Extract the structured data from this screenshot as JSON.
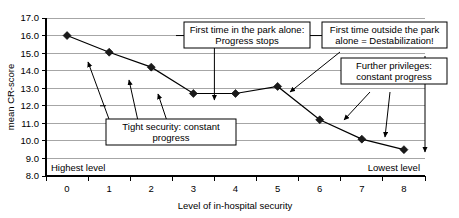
{
  "chart_data": {
    "type": "line",
    "title": "",
    "xlabel": "Level of in-hospital security",
    "ylabel": "mean CR-score",
    "categories": [
      "0",
      "1",
      "2",
      "3",
      "4",
      "5",
      "6",
      "7",
      "8"
    ],
    "x": [
      0,
      1,
      2,
      3,
      4,
      5,
      6,
      7,
      8
    ],
    "values": [
      16.0,
      15.05,
      14.2,
      12.7,
      12.7,
      13.1,
      11.2,
      10.1,
      9.5
    ],
    "series": [
      {
        "name": "mean CR-score",
        "values": [
          16.0,
          15.05,
          14.2,
          12.7,
          12.7,
          13.1,
          11.2,
          10.1,
          9.5
        ]
      }
    ],
    "ylim": [
      8.0,
      17.0
    ],
    "ytick_labels": [
      "8.0",
      "9.0",
      "10.0",
      "11.0",
      "12.0",
      "13.0",
      "14.0",
      "15.0",
      "16.0",
      "17.0"
    ],
    "ytick_values": [
      8.0,
      9.0,
      10.0,
      11.0,
      12.0,
      13.0,
      14.0,
      15.0,
      16.0,
      17.0
    ],
    "xtick_labels": [
      "0",
      "1",
      "2",
      "3",
      "4",
      "5",
      "6",
      "7",
      "8"
    ],
    "grid": "horizontal",
    "legend": "none",
    "marker": "diamond",
    "line_color": "#000000",
    "marker_color": "#1a1a1a",
    "grid_color": "#a6a6a6"
  },
  "annotations": {
    "plot_labels": [
      {
        "id": "highest-level",
        "text": "Highest level"
      },
      {
        "id": "lowest-level",
        "text": "Lowest level"
      }
    ],
    "callouts": [
      {
        "id": "tight-security",
        "line1": "Tight security: constant",
        "line2": "progress"
      },
      {
        "id": "first-time-park-alone",
        "line1": "First time in the park alone:",
        "line2": "Progress stops"
      },
      {
        "id": "first-time-outside-park",
        "line1": "First time outside the park",
        "line2": "alone = Destabilization!"
      },
      {
        "id": "further-privileges",
        "line1": "Further privileges:",
        "line2": "constant progress"
      }
    ]
  }
}
